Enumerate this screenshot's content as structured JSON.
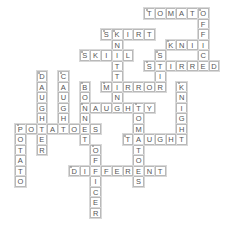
{
  "puzzle": {
    "type": "crossword",
    "grid": {
      "origin_x": 15,
      "origin_y": 8,
      "cell_w": 10.75,
      "cell_h": 10.5
    },
    "colors": {
      "cell_border": "#b9b9b9",
      "cell_fill": "#ffffff",
      "letter": "#555555"
    },
    "words": [
      {
        "answer": "TOMATO",
        "dir": "across",
        "row": 0,
        "col": 12,
        "start_marker": true
      },
      {
        "answer": "OFFICE",
        "dir": "down",
        "row": 0,
        "col": 17,
        "start_marker": true
      },
      {
        "answer": "SKIRT",
        "dir": "across",
        "row": 2,
        "col": 8,
        "start_marker": true
      },
      {
        "answer": "KNITTING",
        "dir": "down",
        "row": 2,
        "col": 9,
        "start_marker": true
      },
      {
        "answer": "KNIT",
        "dir": "across",
        "row": 3,
        "col": 14,
        "start_marker": true
      },
      {
        "answer": "SKILL",
        "dir": "across",
        "row": 4,
        "col": 6,
        "start_marker": true
      },
      {
        "answer": "STIR",
        "dir": "down",
        "row": 4,
        "col": 13,
        "start_marker": true
      },
      {
        "answer": "STIRRED",
        "dir": "across",
        "row": 5,
        "col": 12,
        "start_marker": true
      },
      {
        "answer": "DAUGHTER",
        "dir": "down",
        "row": 6,
        "col": 2,
        "start_marker": true
      },
      {
        "answer": "CAUGHT",
        "dir": "down",
        "row": 6,
        "col": 4,
        "start_marker": true
      },
      {
        "answer": "BONNET",
        "dir": "down",
        "row": 7,
        "col": 6,
        "start_marker": true
      },
      {
        "answer": "MIRROR",
        "dir": "across",
        "row": 7,
        "col": 8,
        "start_marker": true
      },
      {
        "answer": "KNIGHT",
        "dir": "down",
        "row": 7,
        "col": 15,
        "start_marker": true
      },
      {
        "answer": "NAUGHTY",
        "dir": "across",
        "row": 9,
        "col": 6,
        "start_marker": true
      },
      {
        "answer": "TOMATOES",
        "dir": "down",
        "row": 9,
        "col": 11,
        "start_marker": true
      },
      {
        "answer": "POTATOES",
        "dir": "across",
        "row": 11,
        "col": 0,
        "start_marker": true
      },
      {
        "answer": "POTATO",
        "dir": "down",
        "row": 11,
        "col": 0,
        "start_marker": false
      },
      {
        "answer": "TAUGHT",
        "dir": "across",
        "row": 12,
        "col": 10,
        "start_marker": true
      },
      {
        "answer": "OFFICER",
        "dir": "down",
        "row": 13,
        "col": 7,
        "start_marker": true
      },
      {
        "answer": "DIFFERENT",
        "dir": "across",
        "row": 15,
        "col": 5,
        "start_marker": true
      }
    ]
  }
}
